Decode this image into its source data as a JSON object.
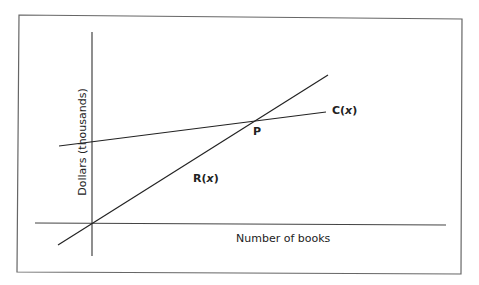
{
  "diagram": {
    "type": "break-even graph",
    "x_axis_label": "Number of books",
    "y_axis_label": "Dollars (thousands)",
    "lines": [
      {
        "name": "R",
        "arg": "x",
        "open": "(",
        "close": ")",
        "description": "Revenue line through origin"
      },
      {
        "name": "C",
        "arg": "x",
        "open": "(",
        "close": ")",
        "description": "Cost line with positive intercept"
      }
    ],
    "point_label": "P",
    "colors": {
      "line": "#333333",
      "frame": "#555555",
      "background": "#ffffff"
    }
  }
}
